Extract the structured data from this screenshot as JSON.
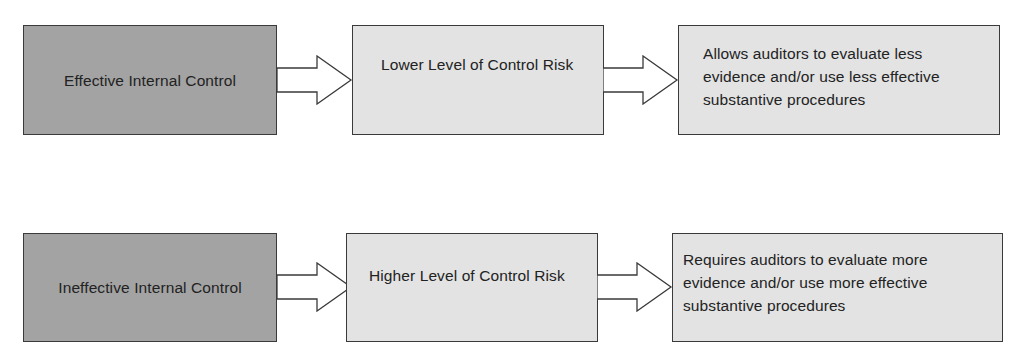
{
  "diagram": {
    "type": "flowchart",
    "rows": [
      {
        "steps": [
          {
            "label": "Effective Internal Control",
            "shade": "dark"
          },
          {
            "label": "Lower Level of Control Risk",
            "shade": "light"
          },
          {
            "label": "Allows auditors to evaluate less evidence and/or use less effective substantive procedures",
            "shade": "light"
          }
        ]
      },
      {
        "steps": [
          {
            "label": "Ineffective Internal Control",
            "shade": "dark"
          },
          {
            "label": "Higher Level of Control Risk",
            "shade": "light"
          },
          {
            "label": "Requires auditors to evaluate more evidence and/or use more effective substantive procedures",
            "shade": "light"
          }
        ]
      }
    ],
    "connector": "block-arrow-right",
    "colors": {
      "dark_box": "#a3a3a3",
      "light_box": "#e3e3e3",
      "border": "#3a3a3a"
    }
  }
}
